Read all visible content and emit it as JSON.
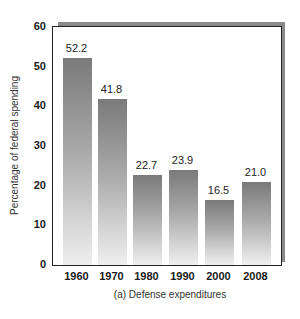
{
  "chart_data": {
    "type": "bar",
    "title": "",
    "caption": "(a) Defense expenditures",
    "xlabel": "",
    "ylabel": "Percentage of federal spending",
    "categories": [
      "1960",
      "1970",
      "1980",
      "1990",
      "2000",
      "2008"
    ],
    "values": [
      52.2,
      41.8,
      22.7,
      23.9,
      16.5,
      21.0
    ],
    "value_labels": [
      "52.2",
      "41.8",
      "22.7",
      "23.9",
      "16.5",
      "21.0"
    ],
    "ylim": [
      0,
      60
    ],
    "yticks": [
      "0",
      "10",
      "20",
      "30",
      "40",
      "50",
      "60"
    ],
    "grid": false,
    "legend": null,
    "bar_style": "vertical gray gradient, dark at top fading to light at bottom",
    "frame": "box with drop shadow on top and right"
  }
}
